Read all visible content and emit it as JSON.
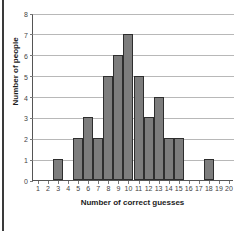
{
  "chart_data": {
    "type": "bar",
    "title": "",
    "subtitle": "",
    "xlabel": "Number of correct guesses",
    "ylabel": "Number of people",
    "categories": [
      "1",
      "2",
      "3",
      "4",
      "5",
      "6",
      "7",
      "8",
      "9",
      "10",
      "11",
      "12",
      "13",
      "14",
      "15",
      "16",
      "17",
      "18",
      "19",
      "20"
    ],
    "values": [
      0,
      0,
      1,
      0,
      2,
      3,
      2,
      5,
      6,
      7,
      5,
      3,
      4,
      2,
      2,
      0,
      0,
      1,
      0,
      0
    ],
    "xlim": [
      1,
      20
    ],
    "ylim": [
      0,
      8
    ],
    "ytick_labels": [
      "0",
      "1",
      "2",
      "3",
      "4",
      "5",
      "6",
      "7",
      "8"
    ],
    "ytick_values": [
      0,
      1,
      2,
      3,
      4,
      5,
      6,
      7,
      8
    ],
    "xtick_labels": [
      "1",
      "2",
      "3",
      "4",
      "5",
      "6",
      "7",
      "8",
      "9",
      "10",
      "11",
      "12",
      "13",
      "14",
      "15",
      "16",
      "17",
      "18",
      "19",
      "20"
    ],
    "grid": "horizontal",
    "legend": "none",
    "annotations": [],
    "colors": {
      "bar_fill": "#7d7d7d",
      "bar_border": "#2e2e2e",
      "gridline": "#b8b8b8",
      "axis": "#555555",
      "tick_text": "#444444",
      "title_text": "#1c1c1c",
      "background": "#ffffff",
      "page_edge": "#3a3a3a"
    }
  }
}
